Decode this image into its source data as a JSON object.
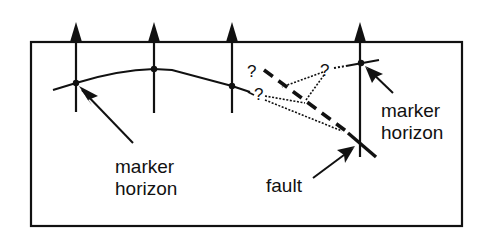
{
  "diagram": {
    "type": "geologic cross-section",
    "colors": {
      "ink": "#111111",
      "background": "#ffffff"
    },
    "wells": [
      {
        "id": "well-1",
        "x": 76
      },
      {
        "id": "well-2",
        "x": 154
      },
      {
        "id": "well-3",
        "x": 232
      },
      {
        "id": "well-4",
        "x": 360
      }
    ],
    "labels": {
      "left_marker_line1": "marker",
      "left_marker_line2": "horizon",
      "right_marker_line1": "marker",
      "right_marker_line2": "horizon",
      "fault": "fault"
    },
    "question_marks": [
      {
        "id": "q-upper-left",
        "text": "?"
      },
      {
        "id": "q-lower-left",
        "text": "?"
      },
      {
        "id": "q-right",
        "text": "?"
      }
    ]
  }
}
